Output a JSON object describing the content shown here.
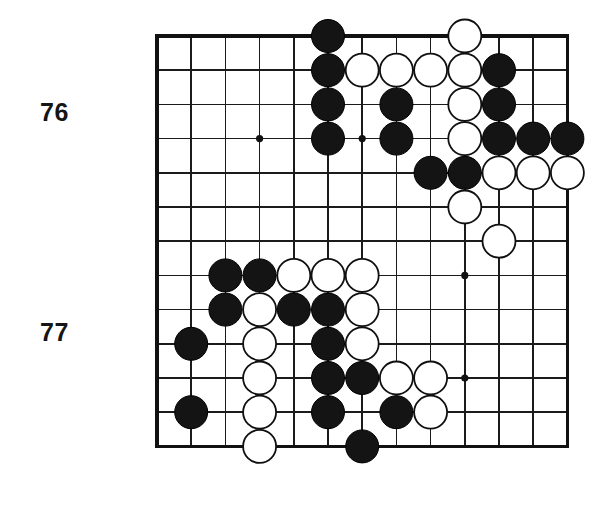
{
  "diagram": {
    "type": "go-board-problem-diagram",
    "title_labels": [
      {
        "text": "76",
        "x": 40,
        "y": 98
      },
      {
        "text": "77",
        "x": 40,
        "y": 318
      }
    ],
    "colors": {
      "black_stone": "#141414",
      "white_stone": "#ffffff",
      "stone_outline": "#101010",
      "grid": "#1b1b1b",
      "border": "#111111",
      "background": "#ffffff",
      "label_text": "#151515"
    }
  },
  "board": {
    "cols": 13,
    "rows": 13,
    "origin_x": 157,
    "origin_y": 36,
    "cell": 34.2,
    "stone_radius": 16.5,
    "star_radius": 3.6,
    "star_points": [
      {
        "col": 4,
        "row": 4
      },
      {
        "col": 4,
        "row": 8
      },
      {
        "col": 7,
        "row": 4
      },
      {
        "col": 7,
        "row": 8
      },
      {
        "col": 10,
        "row": 8
      },
      {
        "col": 10,
        "row": 11
      }
    ],
    "stones": [
      {
        "col": 6,
        "row": 1,
        "color": "black"
      },
      {
        "col": 10,
        "row": 1,
        "color": "white"
      },
      {
        "col": 6,
        "row": 2,
        "color": "black"
      },
      {
        "col": 7,
        "row": 2,
        "color": "white"
      },
      {
        "col": 8,
        "row": 2,
        "color": "white"
      },
      {
        "col": 9,
        "row": 2,
        "color": "white"
      },
      {
        "col": 10,
        "row": 2,
        "color": "white"
      },
      {
        "col": 11,
        "row": 2,
        "color": "black"
      },
      {
        "col": 6,
        "row": 3,
        "color": "black"
      },
      {
        "col": 8,
        "row": 3,
        "color": "black"
      },
      {
        "col": 10,
        "row": 3,
        "color": "white"
      },
      {
        "col": 11,
        "row": 3,
        "color": "black"
      },
      {
        "col": 6,
        "row": 4,
        "color": "black"
      },
      {
        "col": 8,
        "row": 4,
        "color": "black"
      },
      {
        "col": 10,
        "row": 4,
        "color": "white"
      },
      {
        "col": 11,
        "row": 4,
        "color": "black"
      },
      {
        "col": 12,
        "row": 4,
        "color": "black"
      },
      {
        "col": 13,
        "row": 4,
        "color": "black"
      },
      {
        "col": 9,
        "row": 5,
        "color": "black"
      },
      {
        "col": 10,
        "row": 5,
        "color": "black"
      },
      {
        "col": 11,
        "row": 5,
        "color": "white"
      },
      {
        "col": 12,
        "row": 5,
        "color": "white"
      },
      {
        "col": 13,
        "row": 5,
        "color": "white"
      },
      {
        "col": 10,
        "row": 6,
        "color": "white"
      },
      {
        "col": 11,
        "row": 7,
        "color": "white"
      },
      {
        "col": 3,
        "row": 8,
        "color": "black"
      },
      {
        "col": 4,
        "row": 8,
        "color": "black"
      },
      {
        "col": 5,
        "row": 8,
        "color": "white"
      },
      {
        "col": 6,
        "row": 8,
        "color": "white"
      },
      {
        "col": 7,
        "row": 8,
        "color": "white"
      },
      {
        "col": 3,
        "row": 9,
        "color": "black"
      },
      {
        "col": 4,
        "row": 9,
        "color": "white"
      },
      {
        "col": 5,
        "row": 9,
        "color": "black"
      },
      {
        "col": 6,
        "row": 9,
        "color": "black"
      },
      {
        "col": 7,
        "row": 9,
        "color": "white"
      },
      {
        "col": 2,
        "row": 10,
        "color": "black"
      },
      {
        "col": 4,
        "row": 10,
        "color": "white"
      },
      {
        "col": 6,
        "row": 10,
        "color": "black"
      },
      {
        "col": 7,
        "row": 10,
        "color": "white"
      },
      {
        "col": 4,
        "row": 11,
        "color": "white"
      },
      {
        "col": 6,
        "row": 11,
        "color": "black"
      },
      {
        "col": 7,
        "row": 11,
        "color": "black"
      },
      {
        "col": 8,
        "row": 11,
        "color": "white"
      },
      {
        "col": 9,
        "row": 11,
        "color": "white"
      },
      {
        "col": 2,
        "row": 12,
        "color": "black"
      },
      {
        "col": 4,
        "row": 12,
        "color": "white"
      },
      {
        "col": 6,
        "row": 12,
        "color": "black"
      },
      {
        "col": 8,
        "row": 12,
        "color": "black"
      },
      {
        "col": 9,
        "row": 12,
        "color": "white"
      },
      {
        "col": 4,
        "row": 13,
        "color": "white"
      },
      {
        "col": 7,
        "row": 13,
        "color": "black"
      }
    ]
  }
}
